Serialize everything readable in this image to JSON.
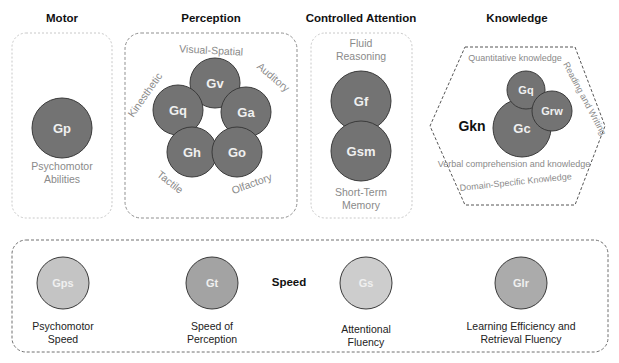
{
  "colors": {
    "dark_circle": "#737373",
    "circle_stroke": "#3a3a3a",
    "light_circle_gps": "#c4c4c4",
    "light_circle_gt": "#a3a3a3",
    "light_circle_gs": "#cdcdcd",
    "light_circle_glr": "#ababab",
    "label_gray": "#8a8a8a"
  },
  "groups": {
    "motor": {
      "title": "Motor",
      "abilities": [
        {
          "code": "Gp",
          "label_line1": "Psychomotor",
          "label_line2": "Abilities"
        }
      ]
    },
    "perception": {
      "title": "Perception",
      "abilities": [
        {
          "code": "Gv",
          "label": "Visual-Spatial"
        },
        {
          "code": "Ga",
          "label": "Auditory"
        },
        {
          "code": "Go",
          "label": "Olfactory"
        },
        {
          "code": "Gh",
          "label": "Tactile"
        },
        {
          "code": "Gq",
          "label": "Kinesthetic"
        }
      ]
    },
    "controlled_attention": {
      "title": "Controlled Attention",
      "abilities": [
        {
          "code": "Gf",
          "label_line1": "Fluid",
          "label_line2": "Reasoning"
        },
        {
          "code": "Gsm",
          "label_line1": "Short-Term",
          "label_line2": "Memory"
        }
      ]
    },
    "knowledge": {
      "title": "Knowledge",
      "group_code": "Gkn",
      "abilities": [
        {
          "code": "Gq",
          "label": "Quantitative knowledge"
        },
        {
          "code": "Grw",
          "label": "Reading and Writing"
        },
        {
          "code": "Gc",
          "label": "Verbal comprehension and knowledge"
        }
      ],
      "outer_label": "Domain-Specific Knowledge"
    },
    "speed": {
      "title": "Speed",
      "abilities": [
        {
          "code": "Gps",
          "label_line1": "Psychomotor",
          "label_line2": "Speed"
        },
        {
          "code": "Gt",
          "label_line1": "Speed of",
          "label_line2": "Perception"
        },
        {
          "code": "Gs",
          "label_line1": "Attentional",
          "label_line2": "Fluency"
        },
        {
          "code": "Glr",
          "label_line1": "Learning Efficiency and",
          "label_line2": "Retrieval Fluency"
        }
      ]
    }
  }
}
